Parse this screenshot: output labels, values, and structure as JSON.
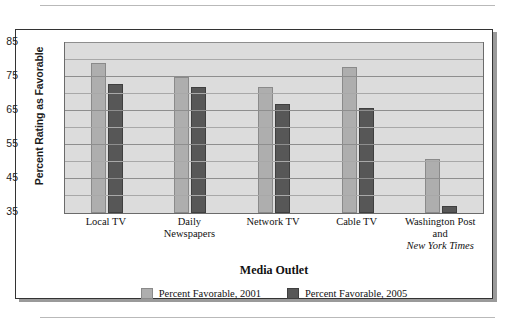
{
  "chart_data": {
    "type": "bar",
    "title": "",
    "xlabel": "Media Outlet",
    "ylabel": "Percent Rating as Favorable",
    "ylim": [
      35,
      85
    ],
    "yticks": [
      35,
      45,
      55,
      65,
      75,
      85
    ],
    "ytick_labels": [
      "35",
      "45",
      "55",
      "65",
      "75",
      "85"
    ],
    "minor_gridlines": [
      40,
      50,
      60,
      70,
      80
    ],
    "grid": true,
    "legend_position": "bottom",
    "categories": [
      "Local TV",
      "Daily Newspapers",
      "Network TV",
      "Cable TV",
      "Washington Post and New York Times"
    ],
    "category_lines": [
      [
        "Local TV"
      ],
      [
        "Daily",
        "Newspapers"
      ],
      [
        "Network TV"
      ],
      [
        "Cable TV"
      ],
      [
        "Washington Post",
        "and",
        "New York Times"
      ]
    ],
    "series": [
      {
        "name": "Percent Favorable, 2001",
        "color": "#aeaeae",
        "values": [
          79,
          75,
          72,
          78,
          51
        ]
      },
      {
        "name": "Percent Favorable, 2005",
        "color": "#575757",
        "values": [
          73,
          72,
          67,
          66,
          37
        ]
      }
    ]
  }
}
